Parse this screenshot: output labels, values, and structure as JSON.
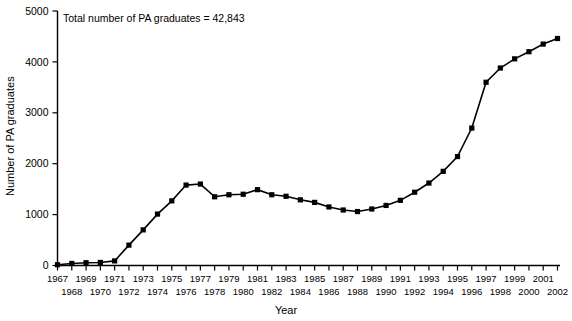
{
  "chart_data": {
    "type": "line",
    "title": "",
    "annotation": "Total number of PA graduates  =  42,843",
    "xlabel": "Year",
    "ylabel": "Number of PA graduates",
    "xlim": [
      1967,
      2002
    ],
    "ylim": [
      0,
      5000
    ],
    "grid": false,
    "legend": false,
    "marker": "square",
    "yticks": [
      0,
      1000,
      2000,
      3000,
      4000,
      5000
    ],
    "ytick_labels": [
      "0",
      "1000",
      "2000",
      "3000",
      "4000",
      "5000"
    ],
    "xticks": [
      1967,
      1968,
      1969,
      1970,
      1971,
      1972,
      1973,
      1974,
      1975,
      1976,
      1977,
      1978,
      1979,
      1980,
      1981,
      1982,
      1983,
      1984,
      1985,
      1986,
      1987,
      1988,
      1989,
      1990,
      1991,
      1992,
      1993,
      1994,
      1995,
      1996,
      1997,
      1998,
      1999,
      2000,
      2001,
      2002
    ],
    "xtick_labels_row1": [
      "1967",
      "",
      "1969",
      "",
      "1971",
      "",
      "1973",
      "",
      "1975",
      "",
      "1977",
      "",
      "1979",
      "",
      "1981",
      "",
      "1983",
      "",
      "1985",
      "",
      "1987",
      "",
      "1989",
      "",
      "1991",
      "",
      "1993",
      "",
      "1995",
      "",
      "1997",
      "",
      "1999",
      "",
      "2001",
      ""
    ],
    "xtick_labels_row2": [
      "",
      "1968",
      "",
      "1970",
      "",
      "1972",
      "",
      "1974",
      "",
      "1976",
      "",
      "1978",
      "",
      "1980",
      "",
      "1982",
      "",
      "1984",
      "",
      "1986",
      "",
      "1988",
      "",
      "1990",
      "",
      "1992",
      "",
      "1994",
      "",
      "1996",
      "",
      "1998",
      "",
      "2000",
      "",
      "2002"
    ],
    "categories": [
      1967,
      1968,
      1969,
      1970,
      1971,
      1972,
      1973,
      1974,
      1975,
      1976,
      1977,
      1978,
      1979,
      1980,
      1981,
      1982,
      1983,
      1984,
      1985,
      1986,
      1987,
      1988,
      1989,
      1990,
      1991,
      1992,
      1993,
      1994,
      1995,
      1996,
      1997,
      1998,
      1999,
      2000,
      2001,
      2002
    ],
    "values": [
      15,
      40,
      55,
      60,
      90,
      400,
      700,
      1010,
      1270,
      1580,
      1600,
      1350,
      1390,
      1400,
      1490,
      1390,
      1360,
      1290,
      1240,
      1150,
      1090,
      1060,
      1110,
      1180,
      1280,
      1440,
      1620,
      1850,
      2140,
      2700,
      3600,
      3880,
      4060,
      4200,
      4350,
      4460
    ],
    "series_name": "PA graduates"
  },
  "axes": {
    "annotation": "Total number of PA graduates  =  42,843",
    "ylabel": "Number of PA graduates",
    "xlabel": "Year"
  }
}
